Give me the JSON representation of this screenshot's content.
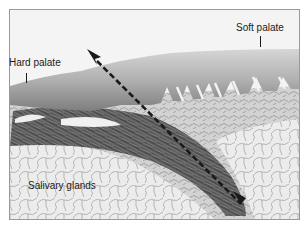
{
  "figure": {
    "type": "histology-micrograph",
    "colors": {
      "background": "#f3f3f3",
      "epithelium": "#b8b8b8",
      "epithelium_dark": "#7a7a7a",
      "connective_tissue": "#c9c9c9",
      "muscle": "#4a4a4a",
      "gland": "#e6e6e6",
      "gland_outline": "#9d9d9d",
      "arrow": "#1a1a1a",
      "frame_border": "#9a9a9a"
    },
    "labels": {
      "hard_palate": "Hard palate",
      "soft_palate": "Soft palate",
      "salivary_glands": "Salivary glands"
    },
    "arrow": {
      "style": "dashed",
      "head_x": 88,
      "head_y": 50,
      "tail_x": 240,
      "tail_y": 203
    }
  }
}
